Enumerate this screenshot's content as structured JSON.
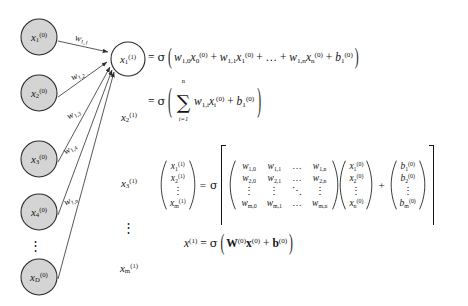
{
  "figure": {
    "colors": {
      "node_fill_input": "#d4d4d4",
      "node_fill_output": "#ffffff",
      "node_stroke": "#2b2b2b",
      "edge": "#3a3a3a",
      "text": "#141414",
      "background": "#ffffff"
    }
  },
  "input_layer": {
    "label": "input layer nodes",
    "nodes": [
      {
        "text_var": "x",
        "sub": "1",
        "sup": "(0)"
      },
      {
        "text_var": "x",
        "sub": "2",
        "sup": "(0)"
      },
      {
        "text_var": "x",
        "sub": "3",
        "sup": "(0)"
      },
      {
        "text_var": "x",
        "sub": "4",
        "sup": "(0)"
      },
      {
        "text_var": "x",
        "sub": "D",
        "sup": "(0)"
      }
    ],
    "ellipsis": "⋮"
  },
  "output_layer": {
    "label": "output layer nodes",
    "active_node": {
      "text_var": "x",
      "sub": "1",
      "sup": "(1)"
    },
    "other_labels": [
      {
        "text_var": "x",
        "sub": "2",
        "sup": "(1)"
      },
      {
        "text_var": "x",
        "sub": "3",
        "sup": "(1)"
      },
      {
        "text_var": "x",
        "sub": "m",
        "sup": "(1)"
      }
    ],
    "ellipsis": "⋮"
  },
  "weights": {
    "label": "edge weight labels",
    "items": [
      {
        "text_var": "w",
        "sub": "1,1"
      },
      {
        "text_var": "w",
        "sub": "1,2"
      },
      {
        "text_var": "w",
        "sub": "1,3"
      },
      {
        "text_var": "w",
        "sub": "1,4"
      },
      {
        "text_var": "w",
        "sub": "1,n"
      }
    ]
  },
  "equations": {
    "scalar_line_1": {
      "eq": "=",
      "sigma": "σ",
      "terms": [
        {
          "w": "w",
          "wsub": "1,0",
          "x": "x",
          "xsub": "0",
          "xsup": "(0)"
        },
        {
          "w": "w",
          "wsub": "1,1",
          "x": "x",
          "xsub": "1",
          "xsup": "(0)"
        },
        {
          "w": "w",
          "wsub": "1,n",
          "x": "x",
          "xsub": "n",
          "xsup": "(0)"
        }
      ],
      "ellipsis": "…",
      "bias": {
        "b": "b",
        "sub": "1",
        "sup": "(0)"
      },
      "plus": "+"
    },
    "scalar_line_2": {
      "eq": "=",
      "sigma": "σ",
      "sum_symbol": "∑",
      "sum_lower": "i=1",
      "sum_upper": "n",
      "summand": {
        "w": "w",
        "wsub": "1,i",
        "x": "x",
        "xsub": "i",
        "xsup": "(0)"
      },
      "plus": "+",
      "bias": {
        "b": "b",
        "sub": "1",
        "sup": "(0)"
      }
    },
    "matrix_line": {
      "eq": "=",
      "sigma": "σ",
      "plus": "+",
      "lhs_vector": {
        "label": "output activation vector",
        "rows": [
          "x_1^(1)",
          "x_2^(1)",
          "⋮",
          "x_m^(1)"
        ],
        "cells": [
          {
            "v": "x",
            "sub": "1",
            "sup": "(1)"
          },
          {
            "v": "x",
            "sub": "2",
            "sup": "(1)"
          },
          {
            "dots": "⋮"
          },
          {
            "v": "x",
            "sub": "m",
            "sup": "(1)"
          }
        ]
      },
      "weight_matrix": {
        "label": "weight matrix W(0)",
        "rows": [
          [
            {
              "v": "w",
              "sub": "1,0"
            },
            {
              "v": "w",
              "sub": "1,1"
            },
            {
              "dots": "…"
            },
            {
              "v": "w",
              "sub": "1,n"
            }
          ],
          [
            {
              "v": "w",
              "sub": "2,0"
            },
            {
              "v": "w",
              "sub": "2,1"
            },
            {
              "dots": "…"
            },
            {
              "v": "w",
              "sub": "2,n"
            }
          ],
          [
            {
              "dots": "⋮"
            },
            {
              "dots": "⋮"
            },
            {
              "dots": "⋱"
            },
            {
              "dots": "⋮"
            }
          ],
          [
            {
              "v": "w",
              "sub": "m,0"
            },
            {
              "v": "w",
              "sub": "m,1"
            },
            {
              "dots": "…"
            },
            {
              "v": "w",
              "sub": "m,n"
            }
          ]
        ]
      },
      "input_vector": {
        "label": "input vector x(0)",
        "cells": [
          {
            "v": "x",
            "sub": "1",
            "sup": "(0)"
          },
          {
            "v": "x",
            "sub": "2",
            "sup": "(0)"
          },
          {
            "dots": "⋮"
          },
          {
            "v": "x",
            "sub": "n",
            "sup": "(0)"
          }
        ]
      },
      "bias_vector": {
        "label": "bias vector b(0)",
        "cells": [
          {
            "v": "b",
            "sub": "1",
            "sup": "(0)"
          },
          {
            "v": "b",
            "sub": "2",
            "sup": "(0)"
          },
          {
            "dots": "⋮"
          },
          {
            "v": "b",
            "sub": "m",
            "sup": "(0)"
          }
        ]
      }
    },
    "compact_line": {
      "lhs": {
        "v": "x",
        "sup": "(1)"
      },
      "eq": "=",
      "sigma": "σ",
      "W": {
        "v": "W",
        "sup": "(0)"
      },
      "x": {
        "v": "x",
        "sup": "(0)"
      },
      "plus": "+",
      "b": {
        "v": "b",
        "sup": "(0)"
      }
    }
  }
}
